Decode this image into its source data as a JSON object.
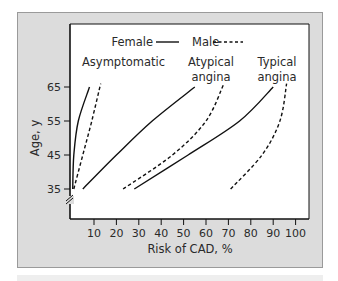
{
  "chart_data": {
    "type": "line",
    "title": "",
    "xlabel": "Risk of CAD, %",
    "ylabel": "Age, y",
    "xlim": [
      0,
      105
    ],
    "ylim": [
      31,
      69
    ],
    "x_ticks": [
      10,
      20,
      30,
      40,
      50,
      60,
      70,
      80,
      90,
      100
    ],
    "y_ticks": [
      35,
      45,
      55,
      65
    ],
    "grid": false,
    "axis_break": "y-axis below 35",
    "legend": {
      "position": "top-center",
      "entries": [
        {
          "label": "Female",
          "style": "solid"
        },
        {
          "label": "Male",
          "style": "dashed"
        }
      ]
    },
    "group_labels": [
      {
        "text": "Asymptomatic",
        "lines": [
          "Asymptomatic"
        ]
      },
      {
        "text": "Atypical angina",
        "lines": [
          "Atypical",
          "angina"
        ]
      },
      {
        "text": "Typical angina",
        "lines": [
          "Typical",
          "angina"
        ]
      }
    ],
    "series": [
      {
        "name": "Female - Asymptomatic",
        "group": "Asymptomatic",
        "sex": "Female",
        "style": "solid",
        "points": [
          [
            0.5,
            35
          ],
          [
            1,
            45
          ],
          [
            3,
            55
          ],
          [
            8,
            65
          ]
        ]
      },
      {
        "name": "Male - Asymptomatic",
        "group": "Asymptomatic",
        "sex": "Male",
        "style": "dashed",
        "points": [
          [
            1,
            35
          ],
          [
            5,
            45
          ],
          [
            9,
            55
          ],
          [
            13,
            66
          ]
        ]
      },
      {
        "name": "Female - Atypical angina",
        "group": "Atypical angina",
        "sex": "Female",
        "style": "solid",
        "points": [
          [
            5,
            35
          ],
          [
            20,
            45
          ],
          [
            36,
            55
          ],
          [
            55,
            65
          ]
        ]
      },
      {
        "name": "Male - Atypical angina",
        "group": "Atypical angina",
        "sex": "Male",
        "style": "dashed",
        "points": [
          [
            23,
            35
          ],
          [
            45,
            45
          ],
          [
            60,
            55
          ],
          [
            68,
            66
          ]
        ]
      },
      {
        "name": "Female - Typical angina",
        "group": "Typical angina",
        "sex": "Female",
        "style": "solid",
        "points": [
          [
            28,
            35
          ],
          [
            52,
            45
          ],
          [
            75,
            55
          ],
          [
            90,
            65
          ]
        ]
      },
      {
        "name": "Male - Typical angina",
        "group": "Typical angina",
        "sex": "Male",
        "style": "dashed",
        "points": [
          [
            71,
            35
          ],
          [
            85,
            45
          ],
          [
            93,
            55
          ],
          [
            96,
            66
          ]
        ]
      }
    ]
  }
}
